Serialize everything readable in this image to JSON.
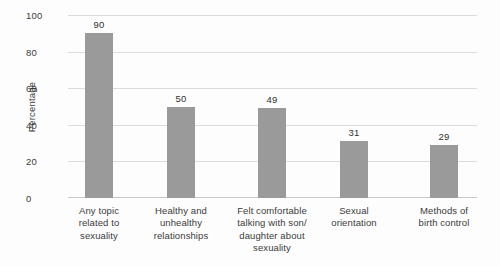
{
  "chart_data": {
    "type": "bar",
    "title": "",
    "xlabel": "",
    "ylabel": "Percentage",
    "ylim": [
      0,
      100
    ],
    "ytick_values": [
      0,
      20,
      40,
      60,
      80,
      100
    ],
    "ytick_labels": [
      "0",
      "20",
      "40",
      "60",
      "80",
      "100"
    ],
    "grid": true,
    "legend": "none",
    "orientation": "vertical",
    "bar_color": "#9a9a9a",
    "gridline_color": "#dcdcdc",
    "text_color": "#3b3b3b",
    "background_color": "#fdfdfd",
    "categories": [
      "Any topic related to sexuality",
      "Healthy and unhealthy relationships",
      "Felt comfortable talking with son/ daughter about sexuality",
      "Sexual orientation",
      "Methods of birth control"
    ],
    "category_lines": [
      [
        "Any topic",
        "related to",
        "sexuality"
      ],
      [
        "Healthy and",
        "unhealthy",
        "relationships"
      ],
      [
        "Felt comfortable",
        "talking with son/",
        "daughter about",
        "sexuality"
      ],
      [
        "Sexual",
        "orientation"
      ],
      [
        "Methods of",
        "birth control"
      ]
    ],
    "values": [
      90,
      50,
      49,
      31,
      29
    ],
    "value_labels": [
      "90",
      "50",
      "49",
      "31",
      "29"
    ]
  },
  "axis": {
    "y_title": "Percentage"
  }
}
